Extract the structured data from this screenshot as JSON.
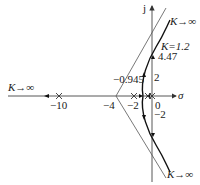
{
  "diagram": {
    "type": "root-locus",
    "axes": {
      "real_label": "σ",
      "imag_label": "j"
    },
    "real_ticks": [
      {
        "value": -10,
        "label": "−10"
      },
      {
        "value": -4,
        "label": "−4"
      },
      {
        "value": -2,
        "label": "−2"
      },
      {
        "value": 0,
        "label": "0"
      }
    ],
    "imag_ticks": [
      {
        "value": 2,
        "label": "2"
      },
      {
        "value": -2,
        "label": "−2"
      }
    ],
    "annotations": {
      "breakaway": "−0.945",
      "crossing_gain": "K=1.2",
      "crossing_value": "4.47",
      "k_inf_left": "K→∞",
      "k_inf_top": "K→∞",
      "k_inf_bottom": "K→∞"
    },
    "poles": [
      -10,
      -2,
      -0.5,
      0
    ],
    "asymptote_center": -4
  }
}
